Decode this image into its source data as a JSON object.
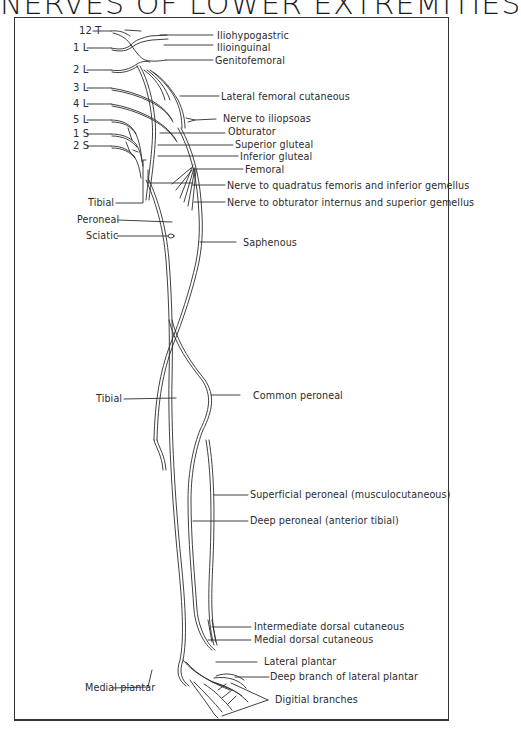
{
  "title": "NERVES OF LOWER EXTREMITIES",
  "roots": [
    {
      "label": "12 T"
    },
    {
      "label": "1 L"
    },
    {
      "label": "2 L"
    },
    {
      "label": "3 L"
    },
    {
      "label": "4 L"
    },
    {
      "label": "5 L"
    },
    {
      "label": "1 S"
    },
    {
      "label": "2 S"
    }
  ],
  "left_labels": [
    {
      "label": "Tibial"
    },
    {
      "label": "Peroneal"
    },
    {
      "label": "Sciatic"
    },
    {
      "label": "Tibial"
    },
    {
      "label": "Medial plantar"
    }
  ],
  "right_labels": [
    {
      "label": "Iliohypogastric"
    },
    {
      "label": "Ilioinguinal"
    },
    {
      "label": "Genitofemoral"
    },
    {
      "label": "Lateral femoral cutaneous"
    },
    {
      "label": "Nerve to iliopsoas"
    },
    {
      "label": "Obturator"
    },
    {
      "label": "Superior gluteal"
    },
    {
      "label": "Inferior gluteal"
    },
    {
      "label": "Femoral"
    },
    {
      "label": "Nerve to quadratus femoris and inferior gemellus"
    },
    {
      "label": "Nerve to obturator internus and superior gemellus"
    },
    {
      "label": "Saphenous"
    },
    {
      "label": "Common peroneal"
    },
    {
      "label": "Superficial peroneal (musculocutaneous)"
    },
    {
      "label": "Deep peroneal (anterior tibial)"
    },
    {
      "label": "Intermediate dorsal cutaneous"
    },
    {
      "label": "Medial dorsal cutaneous"
    },
    {
      "label": "Lateral plantar"
    },
    {
      "label": "Deep branch of lateral plantar"
    },
    {
      "label": "Digitial branches"
    }
  ],
  "colors": {
    "ink": "#2b2b2b",
    "background": "#ffffff"
  }
}
